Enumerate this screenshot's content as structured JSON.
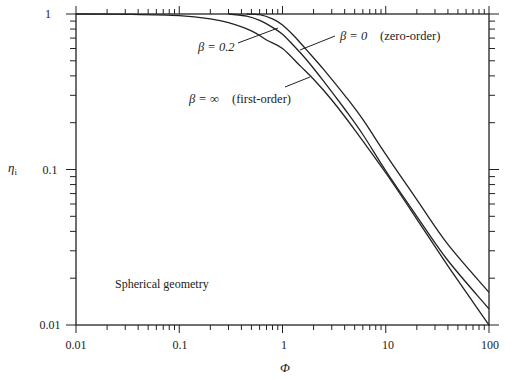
{
  "chart_data": {
    "type": "line",
    "title": "",
    "xlabel": "Φ",
    "ylabel": "η",
    "ylabel_subscript": "i",
    "xscale": "log",
    "yscale": "log",
    "xlim": [
      0.01,
      100
    ],
    "ylim": [
      0.01,
      1
    ],
    "grid": false,
    "x_tick_labels": [
      "0.01",
      "0.1",
      "1",
      "10",
      "100"
    ],
    "x_ticks": [
      0.01,
      0.1,
      1,
      10,
      100
    ],
    "y_tick_labels": [
      "0.01",
      "0.1",
      "1"
    ],
    "y_ticks": [
      0.01,
      0.1,
      1
    ],
    "annotation": "Spherical geometry",
    "series": [
      {
        "name": "β = 0  (zero-order)",
        "x": [
          0.45,
          0.6,
          0.8,
          1.0,
          1.3,
          1.7,
          2.5,
          4,
          6,
          10,
          20,
          40,
          100
        ],
        "y": [
          1.0,
          0.99,
          0.93,
          0.85,
          0.72,
          0.59,
          0.44,
          0.3,
          0.21,
          0.125,
          0.064,
          0.033,
          0.0162
        ]
      },
      {
        "name": "β = 0.2",
        "x": [
          0.3,
          0.45,
          0.6,
          0.8,
          1.0,
          1.3,
          1.7,
          2.5,
          4,
          6,
          10,
          20,
          40,
          100
        ],
        "y": [
          1.0,
          0.97,
          0.91,
          0.82,
          0.74,
          0.62,
          0.51,
          0.37,
          0.245,
          0.168,
          0.098,
          0.05,
          0.026,
          0.0127
        ]
      },
      {
        "name": "β = ∞  (first-order)",
        "x": [
          0.01,
          0.03,
          0.1,
          0.2,
          0.3,
          0.5,
          0.7,
          1.0,
          1.5,
          2,
          3,
          5,
          10,
          20,
          40,
          100
        ],
        "y": [
          1.0,
          0.995,
          0.975,
          0.93,
          0.88,
          0.78,
          0.68,
          0.6,
          0.46,
          0.38,
          0.28,
          0.18,
          0.095,
          0.048,
          0.024,
          0.01
        ]
      }
    ],
    "labels": [
      {
        "text": "β = 0  (zero-order)",
        "series": 0
      },
      {
        "text": "β = 0.2",
        "series": 1
      },
      {
        "text": "β = ∞  (first-order)",
        "series": 2
      }
    ]
  },
  "labels": {
    "beta0": "β = 0",
    "beta0_note": "(zero-order)",
    "beta02": "β = 0.2",
    "betainf": "β =  ∞",
    "betainf_note": "(first-order)",
    "annotation": "Spherical geometry",
    "xlabel": "Φ",
    "ylabel": "η",
    "ylabel_sub": "i",
    "x_ticks": [
      "0.01",
      "0.1",
      "1",
      "10",
      "100"
    ],
    "y_ticks": [
      "1",
      "0.1",
      "0.01"
    ]
  }
}
